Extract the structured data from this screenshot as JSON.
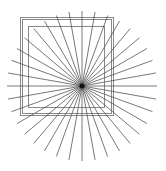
{
  "figure": {
    "width": 166,
    "height": 171,
    "background": "#ffffff",
    "starburst": {
      "center": [
        82,
        86
      ],
      "radius": 75,
      "ray_count": 36,
      "angle_step_deg": 10,
      "stroke": "#555555",
      "stroke_width": 0.8,
      "center_dot_radius": 2.5,
      "center_dot_color": "#111111"
    },
    "outer_square": {
      "x": 20,
      "y": 17,
      "width": 93,
      "height": 98,
      "stroke": "#888888",
      "double_line_gap": 2
    },
    "inner_square": {
      "x": 28,
      "y": 26,
      "width": 76,
      "height": 81,
      "stroke": "#888888"
    }
  }
}
